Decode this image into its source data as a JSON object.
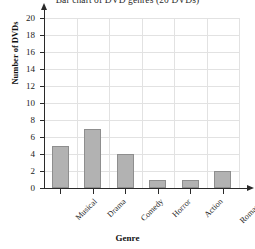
{
  "chart_data": {
    "type": "bar",
    "title": "Bar chart of DVD genres (20 DVDs)",
    "xlabel": "Genre",
    "ylabel": "Number of DVDs",
    "categories": [
      "Musical",
      "Drama",
      "Comedy",
      "Horror",
      "Action",
      "Romance"
    ],
    "values": [
      5,
      7,
      4,
      1,
      1,
      2
    ],
    "ylim": [
      0,
      20
    ],
    "ytick_step": 2,
    "yticks": [
      0,
      2,
      4,
      6,
      8,
      10,
      12,
      14,
      16,
      18,
      20
    ],
    "ytick_labels": [
      "0",
      "2",
      "4",
      "6",
      "8",
      "10",
      "12",
      "14",
      "16",
      "18",
      "20"
    ],
    "grid": true,
    "grid_axes": "both",
    "legend": false,
    "bar_color": "#b2b2b2",
    "bar_edge_color": "#8e8e8e",
    "grid_color": "#e2e2e2",
    "axis_color": "#2a2a2a",
    "total": 20
  }
}
